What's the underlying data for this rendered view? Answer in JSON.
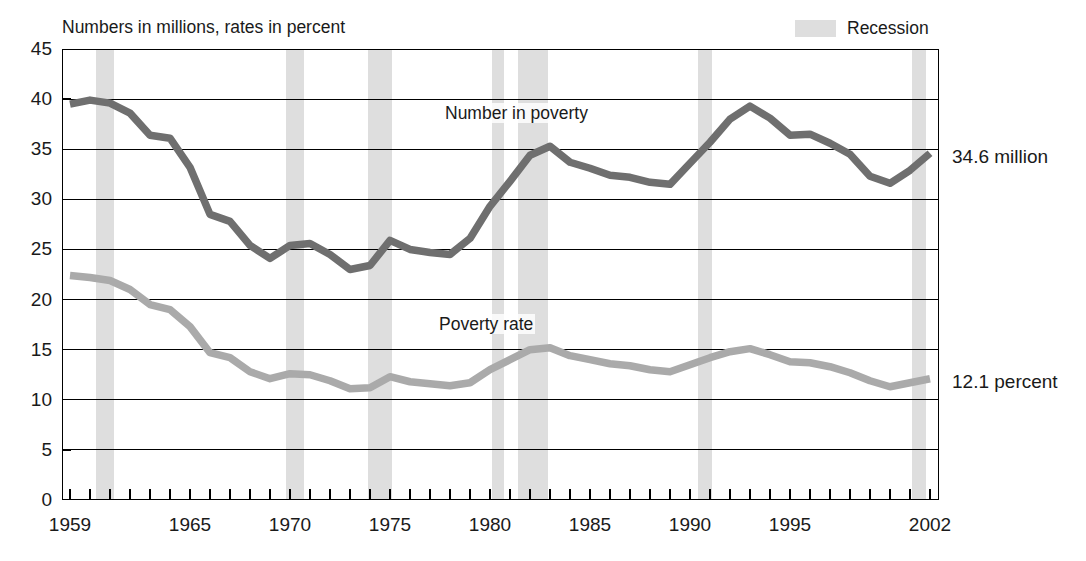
{
  "subtitle": "Numbers in millions, rates in percent",
  "legend": {
    "items": [
      {
        "label": "Recession",
        "color": "#dedede"
      }
    ]
  },
  "annotations": {
    "number_in_poverty": "Number in poverty",
    "poverty_rate": "Poverty rate",
    "end_number": "34.6 million",
    "end_rate": "12.1 percent"
  },
  "chart_data": {
    "type": "line",
    "title": "",
    "subtitle": "Numbers in millions, rates in percent",
    "xlabel": "",
    "ylabel": "",
    "xlim": [
      1959,
      2002
    ],
    "ylim": [
      0,
      45
    ],
    "y_ticks": [
      0,
      5,
      10,
      15,
      20,
      25,
      30,
      35,
      40,
      45
    ],
    "x_tick_labels": [
      1959,
      1965,
      1970,
      1975,
      1980,
      1985,
      1990,
      1995,
      2002
    ],
    "x_minor_tick_every": 1,
    "grid": "horizontal",
    "legend_position": "top-right",
    "x": [
      1959,
      1960,
      1961,
      1962,
      1963,
      1964,
      1965,
      1966,
      1967,
      1968,
      1969,
      1970,
      1971,
      1972,
      1973,
      1974,
      1975,
      1976,
      1977,
      1978,
      1979,
      1980,
      1981,
      1982,
      1983,
      1984,
      1985,
      1986,
      1987,
      1988,
      1989,
      1990,
      1991,
      1992,
      1993,
      1994,
      1995,
      1996,
      1997,
      1998,
      1999,
      2000,
      2001,
      2002
    ],
    "series": [
      {
        "name": "Number in poverty",
        "color": "#6f6f6f",
        "units": "millions",
        "end_label": "34.6 million",
        "values": [
          39.5,
          39.9,
          39.6,
          38.6,
          36.4,
          36.1,
          33.2,
          28.5,
          27.8,
          25.4,
          24.1,
          25.4,
          25.6,
          24.5,
          23.0,
          23.4,
          25.9,
          25.0,
          24.7,
          24.5,
          26.1,
          29.3,
          31.8,
          34.4,
          35.3,
          33.7,
          33.1,
          32.4,
          32.2,
          31.7,
          31.5,
          33.6,
          35.7,
          38.0,
          39.3,
          38.1,
          36.4,
          36.5,
          35.6,
          34.5,
          32.3,
          31.6,
          32.9,
          34.6
        ]
      },
      {
        "name": "Poverty rate",
        "color": "#aaaaaa",
        "units": "percent",
        "end_label": "12.1 percent",
        "values": [
          22.4,
          22.2,
          21.9,
          21.0,
          19.5,
          19.0,
          17.3,
          14.7,
          14.2,
          12.8,
          12.1,
          12.6,
          12.5,
          11.9,
          11.1,
          11.2,
          12.3,
          11.8,
          11.6,
          11.4,
          11.7,
          13.0,
          14.0,
          15.0,
          15.2,
          14.4,
          14.0,
          13.6,
          13.4,
          13.0,
          12.8,
          13.5,
          14.2,
          14.8,
          15.1,
          14.5,
          13.8,
          13.7,
          13.3,
          12.7,
          11.9,
          11.3,
          11.7,
          12.1
        ]
      }
    ],
    "recessions": [
      {
        "start": 1960.3,
        "end": 1961.2
      },
      {
        "start": 1969.8,
        "end": 1970.7
      },
      {
        "start": 1973.9,
        "end": 1975.1
      },
      {
        "start": 1980.1,
        "end": 1980.6
      },
      {
        "start": 1981.4,
        "end": 1982.9
      },
      {
        "start": 1990.4,
        "end": 1991.1
      },
      {
        "start": 2001.1,
        "end": 2001.8
      }
    ]
  }
}
